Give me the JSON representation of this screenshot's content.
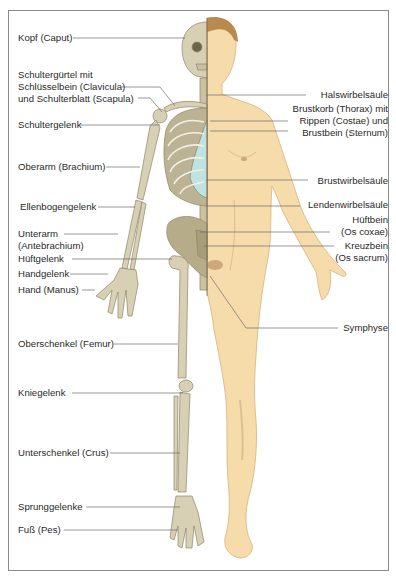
{
  "figure": {
    "left_labels": [
      {
        "id": "kopf",
        "lines": [
          "Kopf (Caput)"
        ],
        "x": 18,
        "y": 33,
        "line_to": [
          185,
          38
        ]
      },
      {
        "id": "schultergurtel",
        "lines": [
          "Schultergürtel mit",
          "Schlüsselbein (Clavicula)",
          "und Schulterblatt (Scapula)"
        ],
        "x": 18,
        "y": 69,
        "line_to": [
          175,
          106
        ]
      },
      {
        "id": "schultergelenk",
        "lines": [
          "Schultergelenk"
        ],
        "x": 18,
        "y": 120,
        "line_to": [
          160,
          125
        ]
      },
      {
        "id": "oberarm",
        "lines": [
          "Oberarm (Brachium)"
        ],
        "x": 18,
        "y": 163,
        "line_to": [
          140,
          167
        ]
      },
      {
        "id": "ellenbogengelenk",
        "lines": [
          "Ellenbogengelenk"
        ],
        "x": 20,
        "y": 203,
        "line_to": [
          135,
          207
        ]
      },
      {
        "id": "unterarm",
        "lines": [
          "Unterarm",
          "(Antebrachium)"
        ],
        "x": 18,
        "y": 229,
        "line_to": [
          118,
          234
        ]
      },
      {
        "id": "huftgelenk",
        "lines": [
          "Hüftgelenk"
        ],
        "x": 18,
        "y": 255,
        "line_to": [
          172,
          259
        ]
      },
      {
        "id": "handgelenk",
        "lines": [
          "Handgelenk"
        ],
        "x": 18,
        "y": 269,
        "line_to": [
          108,
          274
        ]
      },
      {
        "id": "hand",
        "lines": [
          "Hand (Manus)"
        ],
        "x": 18,
        "y": 285,
        "line_to": [
          95,
          290
        ]
      },
      {
        "id": "oberschenkel",
        "lines": [
          "Oberschenkel (Femur)"
        ],
        "x": 18,
        "y": 340,
        "line_to": [
          178,
          344
        ]
      },
      {
        "id": "kniegelenk",
        "lines": [
          "Kniegelenk"
        ],
        "x": 18,
        "y": 389,
        "line_to": [
          183,
          393
        ]
      },
      {
        "id": "unterschenkel",
        "lines": [
          "Unterschenkel (Crus)"
        ],
        "x": 18,
        "y": 449,
        "line_to": [
          180,
          453
        ]
      },
      {
        "id": "sprunggelenke",
        "lines": [
          "Sprunggelenke"
        ],
        "x": 18,
        "y": 503,
        "line_to": [
          180,
          507
        ]
      },
      {
        "id": "fuss",
        "lines": [
          "Fuß (Pes)"
        ],
        "x": 18,
        "y": 526,
        "line_to": [
          178,
          530
        ]
      }
    ],
    "right_labels": [
      {
        "id": "halswirbelsaule",
        "lines": [
          "Halswirbelsäule"
        ],
        "right": 389,
        "y": 90,
        "line_to": [
          206,
          95
        ]
      },
      {
        "id": "brustkorb",
        "lines": [
          "Brustkorb (Thorax) mit",
          "Rippen (Costae) und",
          "Brustbein (Sternum)"
        ],
        "right": 389,
        "y": 104,
        "line_to": [
          210,
          121
        ]
      },
      {
        "id": "brustwirbelsaule",
        "lines": [
          "Brustwirbelsäule"
        ],
        "right": 389,
        "y": 177,
        "line_to": [
          206,
          180
        ]
      },
      {
        "id": "lendenwirbelsaule",
        "lines": [
          "Lendenwirbelsäule"
        ],
        "right": 389,
        "y": 200,
        "line_to": [
          206,
          206
        ]
      },
      {
        "id": "huftbein",
        "lines": [
          "Hüftbein",
          "(Os coxae)"
        ],
        "right": 389,
        "y": 215,
        "line_to": [
          200,
          232
        ]
      },
      {
        "id": "kreuzbein",
        "lines": [
          "Kreuzbein",
          "(Os sacrum)"
        ],
        "right": 389,
        "y": 241,
        "line_to": [
          204,
          246
        ]
      },
      {
        "id": "symphyse",
        "lines": [
          "Symphyse"
        ],
        "right": 389,
        "y": 322,
        "line_to": [
          210,
          276
        ]
      }
    ],
    "colors": {
      "bone": "#d8d0b4",
      "bone_dark": "#8f8466",
      "skin": "#f6dcaa",
      "skin_shade": "#dcc190",
      "cartilage": "#bfe2e2",
      "hair": "#b88a4e",
      "line": "#6c6c6c",
      "frame": "#8a8a8a"
    }
  }
}
